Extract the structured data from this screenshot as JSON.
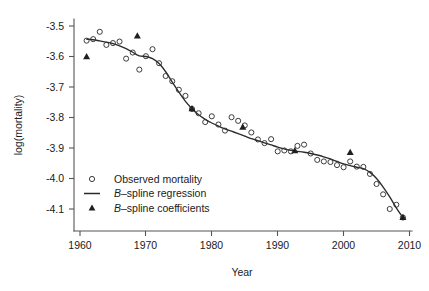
{
  "chart_data": {
    "type": "scatter",
    "title": "",
    "xlabel": "Year",
    "ylabel": "log(mortality)",
    "xlim": [
      1958.5,
      2010.8
    ],
    "ylim": [
      -4.155,
      -3.47
    ],
    "grid": false,
    "legend_position": "lower-left-inside",
    "x_ticks": [
      1960,
      1970,
      1980,
      1990,
      2000,
      2010
    ],
    "x_tick_labels": [
      "1960",
      "1970",
      "1980",
      "1990",
      "2000",
      "2010"
    ],
    "y_ticks": [
      -3.5,
      -3.6,
      -3.7,
      -3.8,
      -3.9,
      -4.0,
      -4.1
    ],
    "y_tick_labels": [
      "-3.5",
      "-3.6",
      "-3.7",
      "-3.8",
      "-3.9",
      "-4.0",
      "-4.1"
    ],
    "series": [
      {
        "name": "Observed mortality",
        "type": "scatter",
        "marker": "open-circle",
        "color": "#333333",
        "x": [
          1961,
          1962,
          1963,
          1964,
          1965,
          1966,
          1967,
          1968,
          1969,
          1970,
          1971,
          1972,
          1973,
          1974,
          1975,
          1976,
          1977,
          1978,
          1979,
          1980,
          1981,
          1982,
          1983,
          1984,
          1985,
          1986,
          1987,
          1988,
          1989,
          1990,
          1991,
          1992,
          1993,
          1994,
          1995,
          1996,
          1997,
          1998,
          1999,
          2000,
          2001,
          2002,
          2003,
          2004,
          2005,
          2006,
          2007,
          2008,
          2009
        ],
        "y": [
          -3.548,
          -3.543,
          -3.519,
          -3.562,
          -3.556,
          -3.551,
          -3.607,
          -3.587,
          -3.643,
          -3.599,
          -3.576,
          -3.622,
          -3.664,
          -3.681,
          -3.709,
          -3.729,
          -3.772,
          -3.786,
          -3.815,
          -3.796,
          -3.823,
          -3.843,
          -3.799,
          -3.811,
          -3.826,
          -3.849,
          -3.872,
          -3.884,
          -3.871,
          -3.911,
          -3.908,
          -3.911,
          -3.893,
          -3.889,
          -3.918,
          -3.939,
          -3.944,
          -3.946,
          -3.956,
          -3.963,
          -3.944,
          -3.961,
          -3.962,
          -3.985,
          -4.018,
          -4.052,
          -4.1,
          -4.086,
          -4.128
        ]
      },
      {
        "name": "B-spline regression",
        "type": "line",
        "color": "#2b2b2b",
        "x": [
          1961,
          1962,
          1963,
          1964,
          1965,
          1966,
          1967,
          1968,
          1969,
          1970,
          1971,
          1972,
          1973,
          1974,
          1975,
          1976,
          1977,
          1978,
          1979,
          1980,
          1981,
          1982,
          1983,
          1984,
          1985,
          1986,
          1987,
          1988,
          1989,
          1990,
          1991,
          1992,
          1993,
          1994,
          1995,
          1996,
          1997,
          1998,
          1999,
          2000,
          2001,
          2002,
          2003,
          2004,
          2005,
          2006,
          2007,
          2008,
          2009
        ],
        "y": [
          -3.543,
          -3.545,
          -3.549,
          -3.553,
          -3.558,
          -3.565,
          -3.574,
          -3.586,
          -3.598,
          -3.6,
          -3.607,
          -3.623,
          -3.65,
          -3.684,
          -3.717,
          -3.747,
          -3.771,
          -3.791,
          -3.806,
          -3.818,
          -3.828,
          -3.837,
          -3.845,
          -3.853,
          -3.861,
          -3.869,
          -3.876,
          -3.883,
          -3.89,
          -3.897,
          -3.903,
          -3.908,
          -3.911,
          -3.914,
          -3.918,
          -3.923,
          -3.929,
          -3.936,
          -3.944,
          -3.952,
          -3.958,
          -3.963,
          -3.968,
          -3.98,
          -4.0,
          -4.028,
          -4.06,
          -4.096,
          -4.128
        ]
      },
      {
        "name": "B-spline coefficients",
        "type": "scatter",
        "marker": "filled-triangle",
        "color": "#1f1f1f",
        "x": [
          1961,
          1968.7,
          1977,
          1984.7,
          1992.6,
          2001,
          2009
        ],
        "y": [
          -3.601,
          -3.533,
          -3.771,
          -3.832,
          -3.909,
          -3.915,
          -4.128
        ]
      }
    ],
    "legend": [
      {
        "label": "Observed mortality",
        "marker": "open-circle",
        "italic_prefix": ""
      },
      {
        "label": "B–spline regression",
        "marker": "line",
        "italic_prefix": "B"
      },
      {
        "label": "B–spline coefficients",
        "marker": "filled-triangle",
        "italic_prefix": "B"
      }
    ]
  },
  "axes": {
    "y_title": "log(mortality)",
    "x_title": "Year",
    "x_tick_labels": [
      "1960",
      "1970",
      "1980",
      "1990",
      "2000",
      "2010"
    ],
    "y_tick_labels": [
      "-3.5",
      "-3.6",
      "-3.7",
      "-3.8",
      "-3.9",
      "-4.0",
      "-4.1"
    ]
  },
  "legend": {
    "item0_label": "Observed mortality",
    "item1_label_ital": "B",
    "item1_label_rest": "–spline regression",
    "item2_label_ital": "B",
    "item2_label_rest": "–spline coefficients"
  },
  "colors": {
    "curve": "#2b2b2b",
    "marker": "#333333",
    "triangle": "#1f1f1f",
    "axis": "#555555",
    "background": "#ffffff"
  }
}
